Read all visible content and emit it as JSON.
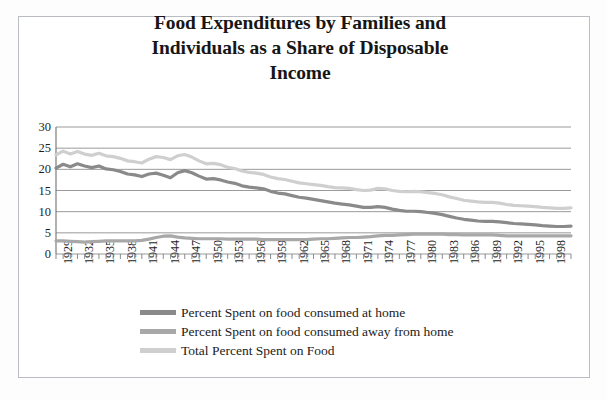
{
  "chart_data": {
    "type": "line",
    "title": "Food Expenditures by Families and Individuals as a Share of Disposable Income",
    "title_line1": "Food Expenditures by Families and",
    "title_line2": "Individuals as a Share of Disposable",
    "title_line3": "Income",
    "xlabel": "",
    "ylabel": "",
    "ylim": [
      0,
      30
    ],
    "yticks": [
      0,
      5,
      10,
      15,
      20,
      25,
      30
    ],
    "grid": true,
    "legend_position": "bottom",
    "x_tick_labels": [
      "1929",
      "1932",
      "1935",
      "1938",
      "1941",
      "1944",
      "1947",
      "1950",
      "1953",
      "1956",
      "1959",
      "1962",
      "1965",
      "1968",
      "1971",
      "1974",
      "1977",
      "1980",
      "1983",
      "1986",
      "1989",
      "1992",
      "1995",
      "1998"
    ],
    "x": [
      1929,
      1930,
      1931,
      1932,
      1933,
      1934,
      1935,
      1936,
      1937,
      1938,
      1939,
      1940,
      1941,
      1942,
      1943,
      1944,
      1945,
      1946,
      1947,
      1948,
      1949,
      1950,
      1951,
      1952,
      1953,
      1954,
      1955,
      1956,
      1957,
      1958,
      1959,
      1960,
      1961,
      1962,
      1963,
      1964,
      1965,
      1966,
      1967,
      1968,
      1969,
      1970,
      1971,
      1972,
      1973,
      1974,
      1975,
      1976,
      1977,
      1978,
      1979,
      1980,
      1981,
      1982,
      1983,
      1984,
      1985,
      1986,
      1987,
      1988,
      1989,
      1990,
      1991,
      1992,
      1993,
      1994,
      1995,
      1996,
      1997,
      1998,
      1999,
      2000,
      2001
    ],
    "series": [
      {
        "name": "Percent Spent on food consumed at home",
        "color": "#8a8a8a",
        "values": [
          20.3,
          21.2,
          20.6,
          21.3,
          20.8,
          20.4,
          20.8,
          20.1,
          19.9,
          19.5,
          18.9,
          18.7,
          18.3,
          18.9,
          19.1,
          18.6,
          18.0,
          19.2,
          19.7,
          19.2,
          18.4,
          17.7,
          17.8,
          17.5,
          17.0,
          16.7,
          16.1,
          15.8,
          15.6,
          15.4,
          14.8,
          14.4,
          14.2,
          13.8,
          13.4,
          13.2,
          12.9,
          12.6,
          12.3,
          12.0,
          11.8,
          11.6,
          11.3,
          11.0,
          11.0,
          11.2,
          11.0,
          10.6,
          10.3,
          10.1,
          10.1,
          10.0,
          9.8,
          9.6,
          9.3,
          8.9,
          8.5,
          8.2,
          8.0,
          7.8,
          7.7,
          7.7,
          7.6,
          7.4,
          7.2,
          7.1,
          7.0,
          6.9,
          6.7,
          6.6,
          6.5,
          6.5,
          6.6
        ],
        "label_note": "dark gray"
      },
      {
        "name": "Percent Spent on food consumed away from home",
        "color": "#a8a8a8",
        "values": [
          3.1,
          3.1,
          3.0,
          2.9,
          2.8,
          2.9,
          3.0,
          3.1,
          3.1,
          3.1,
          3.1,
          3.1,
          3.2,
          3.5,
          3.9,
          4.2,
          4.3,
          4.0,
          3.8,
          3.7,
          3.6,
          3.6,
          3.6,
          3.6,
          3.5,
          3.5,
          3.5,
          3.5,
          3.5,
          3.4,
          3.4,
          3.4,
          3.4,
          3.4,
          3.4,
          3.4,
          3.5,
          3.6,
          3.6,
          3.7,
          3.8,
          3.9,
          3.9,
          4.0,
          4.1,
          4.3,
          4.4,
          4.4,
          4.5,
          4.6,
          4.7,
          4.7,
          4.7,
          4.7,
          4.7,
          4.6,
          4.6,
          4.5,
          4.5,
          4.5,
          4.5,
          4.5,
          4.4,
          4.3,
          4.3,
          4.3,
          4.3,
          4.3,
          4.3,
          4.3,
          4.3,
          4.3,
          4.3
        ],
        "label_note": "medium gray"
      },
      {
        "name": "Total Percent Spent on Food",
        "color": "#cfcfcf",
        "values": [
          23.4,
          24.3,
          23.6,
          24.2,
          23.6,
          23.3,
          23.8,
          23.2,
          23.0,
          22.6,
          22.0,
          21.8,
          21.5,
          22.4,
          23.0,
          22.8,
          22.3,
          23.2,
          23.5,
          22.9,
          22.0,
          21.3,
          21.4,
          21.1,
          20.5,
          20.2,
          19.6,
          19.3,
          19.1,
          18.8,
          18.2,
          17.8,
          17.6,
          17.2,
          16.8,
          16.6,
          16.4,
          16.2,
          15.9,
          15.7,
          15.6,
          15.5,
          15.2,
          15.0,
          15.1,
          15.5,
          15.4,
          15.0,
          14.8,
          14.7,
          14.8,
          14.7,
          14.5,
          14.3,
          14.0,
          13.5,
          13.1,
          12.7,
          12.5,
          12.3,
          12.2,
          12.2,
          12.0,
          11.7,
          11.5,
          11.4,
          11.3,
          11.2,
          11.0,
          10.9,
          10.8,
          10.8,
          10.9
        ],
        "label_note": "light gray"
      }
    ]
  },
  "legend": {
    "items": [
      {
        "label": "Percent Spent on food consumed at home",
        "color": "#8a8a8a"
      },
      {
        "label": "Percent Spent on food consumed away from home",
        "color": "#a8a8a8"
      },
      {
        "label": "Total Percent Spent on Food",
        "color": "#cfcfcf"
      }
    ]
  },
  "colors": {
    "at_home": "#8a8a8a",
    "away_from_home": "#a8a8a8",
    "total": "#cfcfcf",
    "grid": "#808080",
    "axis": "#707070",
    "text": "#1b1b1b",
    "border": "#b9bcc0"
  }
}
